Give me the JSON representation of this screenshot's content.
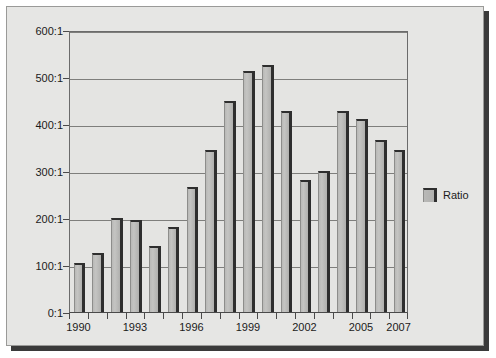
{
  "chart_data": {
    "type": "bar",
    "title": "",
    "xlabel": "",
    "ylabel": "",
    "ylim": [
      0,
      600
    ],
    "ytick_values": [
      0,
      100,
      200,
      300,
      400,
      500,
      600
    ],
    "ytick_labels": [
      "0:1",
      "100:1",
      "200:1",
      "300:1",
      "400:1",
      "500:1",
      "600:1"
    ],
    "grid": true,
    "legend": {
      "position": "right",
      "entries": [
        {
          "name": "Ratio",
          "color": "#b9b9b7"
        }
      ]
    },
    "categories": [
      "1990",
      "1991",
      "1992",
      "1993",
      "1994",
      "1995",
      "1996",
      "1997",
      "1998",
      "1999",
      "2000",
      "2001",
      "2002",
      "2003",
      "2004",
      "2005",
      "2006",
      "2007"
    ],
    "xtick_labels_shown": [
      "1990",
      "1993",
      "1996",
      "1999",
      "2002",
      "2005",
      "2007"
    ],
    "series": [
      {
        "name": "Ratio",
        "values": [
          105,
          125,
          200,
          195,
          140,
          180,
          267,
          345,
          450,
          512,
          525,
          428,
          280,
          300,
          428,
          410,
          365,
          345
        ]
      }
    ]
  },
  "legend": {
    "label": "Ratio"
  }
}
